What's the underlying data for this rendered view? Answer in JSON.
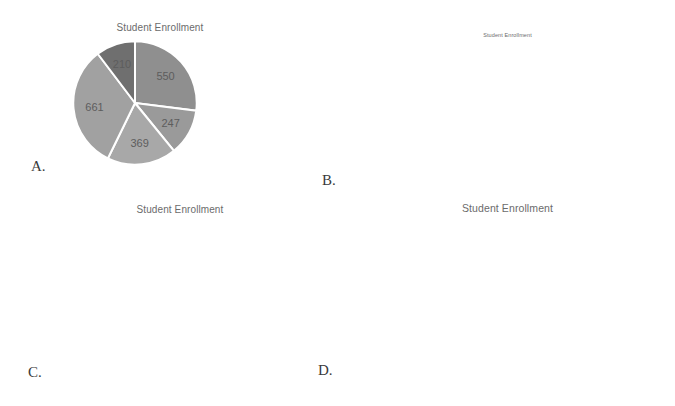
{
  "colors": {
    "bar_gray": "#8a8a8a",
    "bar_gray_dark": "#7d7d7d",
    "bar_gray_light": "#a3a3a3",
    "grid": "#e6e6e6",
    "text": "#6f6f6f"
  },
  "panels": {
    "a_label": "A.",
    "b_label": "B.",
    "c_label": "C.",
    "d_label": "D."
  },
  "legend_swatch_colors": [
    "#7d7d7d",
    "#8d8d8d",
    "#a0a0a0",
    "#b4b4b4",
    "#6e6e6e"
  ],
  "chart_data": [
    {
      "id": "A",
      "type": "pie",
      "title": "Student Enrollment",
      "labels": [
        "College of Business",
        "College of Engineering",
        "College of Liberal Arts",
        "College of Natural Sciences",
        "College of Technology"
      ],
      "values": [
        550,
        247,
        369,
        661,
        210
      ],
      "data_labels": [
        "550",
        "247",
        "369",
        "661",
        "210"
      ],
      "slice_colors": [
        "#8f8f8f",
        "#9a9a9a",
        "#a8a8a8",
        "#a1a1a1",
        "#6f6f6f"
      ],
      "legend_position": "right",
      "grid": false
    },
    {
      "id": "B",
      "type": "bar",
      "title": "Student Enrollment",
      "categories": [
        "College of Business",
        "College of Engineering",
        "College of Liberal Arts",
        "College of Natural Sciences",
        "College of Technology"
      ],
      "series": [
        {
          "name": "Males",
          "values": [
            250,
            150,
            140,
            500,
            100
          ],
          "color": "#8d8d8d"
        },
        {
          "name": "Females",
          "values": [
            300,
            97,
            229,
            515,
            110
          ],
          "color": "#9a9a9a"
        },
        {
          "name": "Total",
          "values": [
            550,
            247,
            369,
            661,
            210
          ],
          "color": "#a8a8a8"
        }
      ],
      "ylim": [
        0,
        700
      ],
      "yticks": [
        0,
        100,
        200,
        300,
        400,
        500,
        600,
        700
      ],
      "ytick_labels": [
        "0",
        "100",
        "200",
        "300",
        "400",
        "500",
        "600",
        "700"
      ],
      "xlabel": "",
      "ylabel": "",
      "grid": true,
      "legend_position": "bottom"
    },
    {
      "id": "C",
      "type": "bar",
      "title": "Student Enrollment",
      "categories": [
        "Males",
        "Females"
      ],
      "values": [
        995,
        1041
      ],
      "ylim": [
        970,
        1050
      ],
      "yticks": [
        970,
        980,
        990,
        1000,
        1010,
        1020,
        1030,
        1040,
        1050
      ],
      "ytick_labels": [
        "970",
        "980",
        "990",
        "1000",
        "1010",
        "1020",
        "1030",
        "1040",
        "1050"
      ],
      "xlabel": "",
      "ylabel": "",
      "grid": true,
      "bar_color": "#8a8a8a"
    },
    {
      "id": "D",
      "type": "bar",
      "title": "Student Enrollment",
      "categories": [
        "College of\nBusiness",
        "College of\nEngineering",
        "College of Liberal\nArts",
        "College of\nNatural Sciences",
        "College of\nTechnology"
      ],
      "values": [
        550,
        247,
        369,
        661,
        210
      ],
      "ylim": [
        0,
        700
      ],
      "yticks": [
        0,
        100,
        200,
        300,
        400,
        500,
        600,
        700
      ],
      "ytick_labels": [
        "0",
        "100",
        "200",
        "300",
        "400",
        "500",
        "600",
        "700"
      ],
      "xlabel": "",
      "ylabel": "",
      "grid": true,
      "bar_color": "#8a8a8a"
    }
  ]
}
